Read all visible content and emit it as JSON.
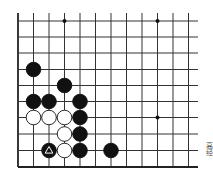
{
  "diagram": {
    "type": "go-board-fragment",
    "grid": {
      "x_lines": [
        18,
        33.5,
        49,
        64.5,
        80,
        95.5,
        111,
        126.5,
        142,
        157.5,
        173,
        188.5
      ],
      "y_lines": [
        21,
        37,
        53,
        69.5,
        85.5,
        101.5,
        117.5,
        134,
        150.5,
        167
      ],
      "top": 13,
      "right": 198,
      "line_color": "#333333",
      "edge_color": "#222222"
    },
    "edges": [
      "left",
      "bottom"
    ],
    "star_points": [
      {
        "col": 3,
        "row": 0
      },
      {
        "col": 9,
        "row": 0
      },
      {
        "col": 9,
        "row": 6
      }
    ],
    "stones": [
      {
        "color": "black",
        "col": 1,
        "row": 3
      },
      {
        "color": "black",
        "col": 3,
        "row": 4
      },
      {
        "color": "black",
        "col": 1,
        "row": 5
      },
      {
        "color": "black",
        "col": 2,
        "row": 5
      },
      {
        "color": "black",
        "col": 4,
        "row": 5
      },
      {
        "color": "white",
        "col": 1,
        "row": 6
      },
      {
        "color": "white",
        "col": 2,
        "row": 6
      },
      {
        "color": "white",
        "col": 3,
        "row": 6
      },
      {
        "color": "black",
        "col": 4,
        "row": 6
      },
      {
        "color": "white",
        "col": 3,
        "row": 7
      },
      {
        "color": "black",
        "col": 4,
        "row": 7
      },
      {
        "color": "black",
        "col": 2,
        "row": 8,
        "marker": "triangle"
      },
      {
        "color": "white",
        "col": 3,
        "row": 8
      },
      {
        "color": "black",
        "col": 4,
        "row": 8
      },
      {
        "color": "black",
        "col": 6,
        "row": 8
      }
    ],
    "stone_radius": 7.3,
    "caption": "高经"
  }
}
